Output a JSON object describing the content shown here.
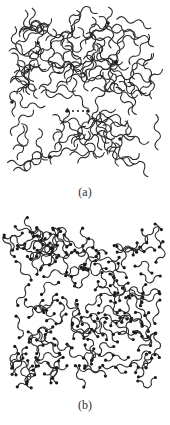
{
  "figure": {
    "panels": [
      {
        "id": "a",
        "caption": "(a)",
        "description": "Network of wavy polymer chains with sparse chain-end dots and one dotted link between two dots",
        "line_color": "#2a2a2a",
        "dot_color": "#1a1a1a"
      },
      {
        "id": "b",
        "caption": "(b)",
        "description": "Dense network of short wavy polymer chains, each ending in dots",
        "line_color": "#2a2a2a",
        "dot_color": "#1a1a1a"
      }
    ]
  }
}
